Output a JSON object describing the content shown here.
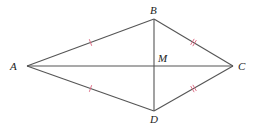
{
  "diagram": {
    "type": "kite",
    "points": {
      "A": {
        "label": "A"
      },
      "B": {
        "label": "B"
      },
      "C": {
        "label": "C"
      },
      "D": {
        "label": "D"
      },
      "M": {
        "label": "M"
      }
    },
    "segments": [
      {
        "id": "AB",
        "from": "A",
        "to": "B",
        "ticks": 1
      },
      {
        "id": "BC",
        "from": "B",
        "to": "C",
        "ticks": 2
      },
      {
        "id": "CD",
        "from": "C",
        "to": "D",
        "ticks": 2
      },
      {
        "id": "DA",
        "from": "D",
        "to": "A",
        "ticks": 1
      },
      {
        "id": "AC",
        "from": "A",
        "to": "C",
        "ticks": 0
      },
      {
        "id": "BD",
        "from": "B",
        "to": "D",
        "ticks": 0
      }
    ],
    "colors": {
      "line": "#555555",
      "tick": "#d9607a",
      "label": "#222222"
    }
  }
}
